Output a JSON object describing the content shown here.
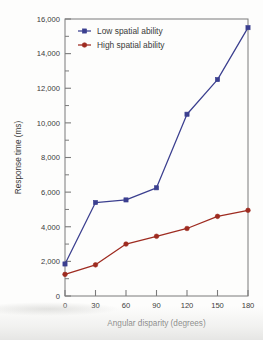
{
  "chart_data": {
    "type": "line",
    "title": "",
    "subtitle": "",
    "xlabel": "Angular disparity (degrees)",
    "ylabel": "Response time (ms)",
    "x": [
      0,
      30,
      60,
      90,
      120,
      150,
      180
    ],
    "categories": [
      "0",
      "30",
      "60",
      "90",
      "120",
      "150",
      "180"
    ],
    "series": [
      {
        "name": "Low spatial ability",
        "color": "#3b3f8f",
        "marker": "square",
        "values": [
          1850,
          5400,
          5550,
          6250,
          10500,
          12500,
          15500
        ]
      },
      {
        "name": "High spatial ability",
        "color": "#9e2b20",
        "marker": "circle",
        "values": [
          1250,
          1800,
          3000,
          3450,
          3900,
          4600,
          4950
        ]
      }
    ],
    "xlim": [
      0,
      180
    ],
    "ylim": [
      0,
      16000
    ],
    "xticks": [
      0,
      30,
      60,
      90,
      120,
      150,
      180
    ],
    "yticks": [
      0,
      2000,
      4000,
      6000,
      8000,
      10000,
      12000,
      14000,
      16000
    ],
    "ytick_labels": [
      "0",
      "2,000",
      "4,000",
      "6,000",
      "8,000",
      "10,000",
      "12,000",
      "14,000",
      "16,000"
    ],
    "y_minor_ticks": [
      1000,
      3000,
      5000,
      7000,
      9000,
      11000,
      13000,
      15000
    ],
    "grid": false,
    "legend_position": "top-left",
    "annotations": []
  },
  "axes": {
    "x_title": "Angular disparity (degrees)",
    "y_title": "Response time (ms)",
    "frame_color": "#7b7b7b"
  },
  "legend": {
    "entries": [
      {
        "label": "Low spatial ability",
        "color": "#3b3f8f"
      },
      {
        "label": "High spatial ability",
        "color": "#9e2b20"
      }
    ]
  }
}
